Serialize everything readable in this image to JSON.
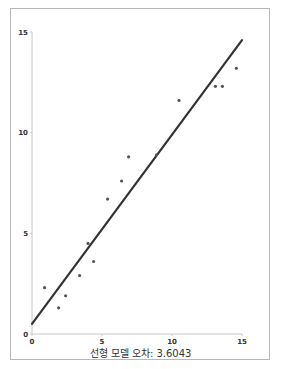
{
  "chart_data": {
    "type": "scatter",
    "title": "",
    "xlabel": "",
    "ylabel": "",
    "caption": "선형 모델 오차: 3.6043",
    "xlim": [
      0,
      15
    ],
    "ylim": [
      0,
      15
    ],
    "x_ticks": [
      0,
      5,
      10,
      15
    ],
    "y_ticks": [
      0,
      5,
      10,
      15
    ],
    "grid": false,
    "legend": null,
    "series": [
      {
        "name": "data points",
        "type": "scatter",
        "color": "#555555",
        "points": [
          {
            "x": 0.9,
            "y": 2.3
          },
          {
            "x": 1.9,
            "y": 1.3
          },
          {
            "x": 2.4,
            "y": 1.9
          },
          {
            "x": 3.4,
            "y": 2.9
          },
          {
            "x": 4.0,
            "y": 4.5
          },
          {
            "x": 4.4,
            "y": 3.6
          },
          {
            "x": 5.4,
            "y": 6.7
          },
          {
            "x": 6.4,
            "y": 7.6
          },
          {
            "x": 6.9,
            "y": 8.8
          },
          {
            "x": 8.9,
            "y": 8.9
          },
          {
            "x": 10.5,
            "y": 11.6
          },
          {
            "x": 13.1,
            "y": 12.3
          },
          {
            "x": 13.6,
            "y": 12.3
          },
          {
            "x": 14.6,
            "y": 13.2
          }
        ]
      },
      {
        "name": "linear model",
        "type": "line",
        "color": "#333333",
        "points": [
          {
            "x": 0,
            "y": 0.5
          },
          {
            "x": 15,
            "y": 14.6
          }
        ]
      }
    ]
  },
  "caption_text": "선형 모델 오차: 3.6043"
}
